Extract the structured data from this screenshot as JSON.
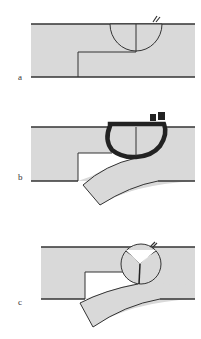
{
  "figure": {
    "panels": [
      {
        "id": "a",
        "label": "a",
        "description": "Semicircular weld across step joint, crack at root"
      },
      {
        "id": "b",
        "label": "b",
        "description": "Thick weld bead around joint, lower plate bent downward"
      },
      {
        "id": "c",
        "label": "c",
        "description": "Weld with Y-shaped fusion lines, lower plate bent downward"
      }
    ],
    "colors": {
      "plate_fill": "#d9d9d9",
      "line": "#333333",
      "bead": "#222222",
      "background": "#ffffff"
    }
  }
}
